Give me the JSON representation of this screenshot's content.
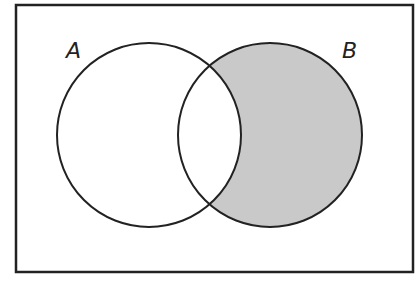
{
  "diagram": {
    "type": "venn",
    "universe": {
      "x": 16,
      "y": 5,
      "width": 397,
      "height": 267
    },
    "sets": [
      {
        "label": "A",
        "cx": 149,
        "cy": 135,
        "r": 92,
        "label_x": 66,
        "label_y": 58
      },
      {
        "label": "B",
        "cx": 270,
        "cy": 135,
        "r": 92,
        "label_x": 342,
        "label_y": 58
      }
    ],
    "shaded_region": "B minus A",
    "colors": {
      "stroke": "#222222",
      "shade": "#c9c9c9",
      "background": "#ffffff"
    }
  }
}
